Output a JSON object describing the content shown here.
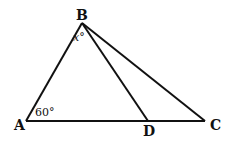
{
  "diagram": {
    "type": "geometry-triangle",
    "points": {
      "A": {
        "label": "A",
        "x": 26,
        "y": 121
      },
      "B": {
        "label": "B",
        "x": 82,
        "y": 23
      },
      "C": {
        "label": "C",
        "x": 205,
        "y": 121
      },
      "D": {
        "label": "D",
        "x": 148,
        "y": 121
      }
    },
    "segments": [
      "AB",
      "BC",
      "AC",
      "BD"
    ],
    "angles": {
      "A": "60°",
      "ABD": "x°"
    },
    "colors": {
      "stroke": "#111111",
      "background": "#ffffff"
    }
  }
}
